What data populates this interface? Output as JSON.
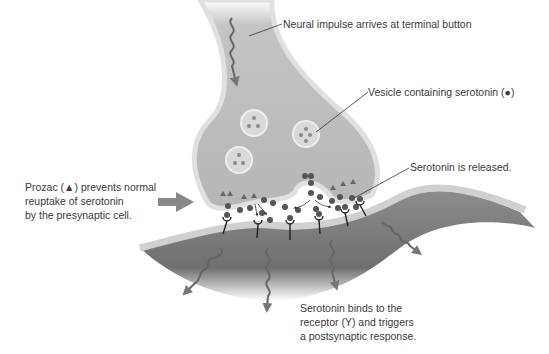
{
  "labels": {
    "impulse": "Neural impulse arrives at terminal button",
    "vesicle": "Vesicle containing serotonin (●)",
    "released": "Serotonin is released.",
    "prozac": [
      "Prozac (▲) prevents normal",
      "reuptake of serotonin",
      "by the presynaptic cell."
    ],
    "binds": [
      "Serotonin binds to the",
      "receptor (Υ) and triggers",
      "a postsynaptic response."
    ]
  },
  "colors": {
    "cell_fill": "#bdbdbd",
    "cell_dark": "#8a8a8a",
    "membrane": "#d6d6d6",
    "vesicle_fill": "#d9d9d9",
    "serotonin": "#555555",
    "arrow": "#888888",
    "leader_line": "#333333",
    "text": "#3a3a3a"
  },
  "icons": {
    "serotonin": "filled-circle",
    "prozac": "filled-triangle",
    "receptor": "y-shaped-receptor",
    "impulse": "wavy-arrow",
    "pointer": "block-arrow-right"
  }
}
